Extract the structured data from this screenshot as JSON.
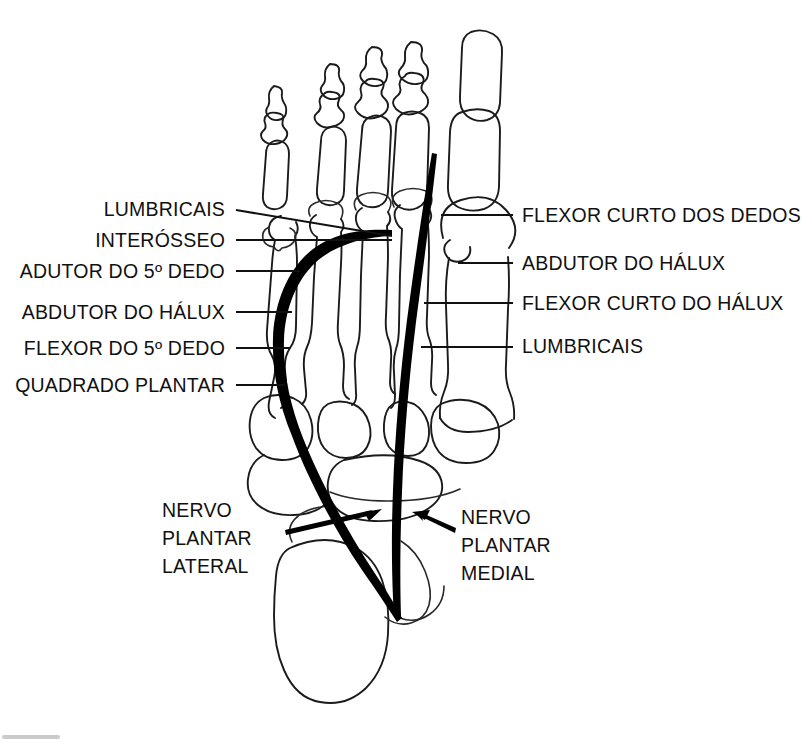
{
  "figure": {
    "ink_color": "#111111",
    "background_color": "#ffffff"
  },
  "labels_left": [
    {
      "id": "lumbricais-left",
      "text": "LUMBRICAIS",
      "x": 225,
      "y": 216,
      "line_x1": 236,
      "line_y1": 210,
      "line_x2": 392,
      "line_y2": 236
    },
    {
      "id": "interosseo",
      "text": "INTERÓSSEO",
      "x": 225,
      "y": 247,
      "line_x1": 236,
      "line_y1": 240,
      "line_x2": 392,
      "line_y2": 240
    },
    {
      "id": "adutor-do-5-dedo",
      "text": "ADUTOR DO 5º DEDO",
      "x": 225,
      "y": 278,
      "line_x1": 236,
      "line_y1": 271,
      "line_x2": 300,
      "line_y2": 271
    },
    {
      "id": "abdutor-do-halux-left",
      "text": "ABDUTOR DO HÁLUX",
      "x": 225,
      "y": 319,
      "line_x1": 236,
      "line_y1": 312,
      "line_x2": 292,
      "line_y2": 312
    },
    {
      "id": "flexor-do-5-dedo",
      "text": "FLEXOR DO 5º DEDO",
      "x": 225,
      "y": 355,
      "line_x1": 236,
      "line_y1": 348,
      "line_x2": 290,
      "line_y2": 348
    },
    {
      "id": "quadrado-plantar",
      "text": "QUADRADO PLANTAR",
      "x": 225,
      "y": 392,
      "line_x1": 236,
      "line_y1": 385,
      "line_x2": 285,
      "line_y2": 385
    }
  ],
  "labels_right": [
    {
      "id": "flexor-curto-dos-dedos",
      "text": "FLEXOR CURTO DOS DEDOS",
      "x": 522,
      "y": 222,
      "line_x1": 441,
      "line_y1": 215,
      "line_x2": 513,
      "line_y2": 215
    },
    {
      "id": "abdutor-do-halux-right",
      "text": "ABDUTOR DO HÁLUX",
      "x": 522,
      "y": 270,
      "line_x1": 458,
      "line_y1": 263,
      "line_x2": 513,
      "line_y2": 263
    },
    {
      "id": "flexor-curto-do-halux",
      "text": "FLEXOR CURTO DO HÁLUX",
      "x": 522,
      "y": 310,
      "line_x1": 424,
      "line_y1": 303,
      "line_x2": 513,
      "line_y2": 303
    },
    {
      "id": "lumbricais-right",
      "text": "LUMBRICAIS",
      "x": 522,
      "y": 353,
      "line_x1": 421,
      "line_y1": 347,
      "line_x2": 513,
      "line_y2": 347
    }
  ],
  "nerve_label_lateral": {
    "id": "nervo-plantar-lateral",
    "lines": [
      "NERVO",
      "PLANTAR",
      "LATERAL"
    ],
    "x": 162,
    "y_start": 517,
    "line_height": 28
  },
  "nerve_label_medial": {
    "id": "nervo-plantar-medial",
    "lines": [
      "NERVO",
      "PLANTAR",
      "MEDIAL"
    ],
    "x": 461,
    "y_start": 524,
    "line_height": 28
  },
  "nerves": [
    {
      "id": "nervo-plantar-lateral-path",
      "name": "Nervo plantar lateral",
      "color": "#000000"
    },
    {
      "id": "nervo-plantar-medial-path",
      "name": "Nervo plantar medial",
      "color": "#000000"
    }
  ]
}
